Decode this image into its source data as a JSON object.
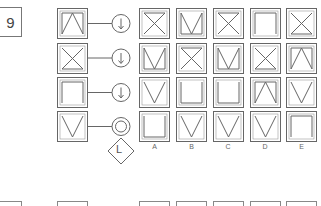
{
  "question": {
    "number": "9"
  },
  "colors": {
    "stroke": "#666666",
    "outer_border": "#777777",
    "background": "#ffffff"
  },
  "sequence_rows": [
    {
      "shape": "lambda-top-bar",
      "operator": "arrow-down"
    },
    {
      "shape": "x-bottom-bar",
      "operator": "arrow-down"
    },
    {
      "shape": "inverted-u",
      "operator": "arrow-down"
    },
    {
      "shape": "v",
      "operator": "double-circle"
    }
  ],
  "final_operator": {
    "shape": "diamond",
    "label": "L"
  },
  "options": {
    "labels": [
      "A",
      "B",
      "C",
      "D",
      "E"
    ],
    "grid": [
      [
        "x-top-bar",
        "m-bottom",
        "x-top-bar",
        "inverted-u",
        "x-bottom-bar"
      ],
      [
        "m-bottom",
        "x-top-bar",
        "m-bottom",
        "x-bottom-bar",
        "lambda-top-bar"
      ],
      [
        "v",
        "u",
        "u",
        "lambda-top-bar",
        "v"
      ],
      [
        "u",
        "v",
        "v",
        "v",
        "inverted-u"
      ]
    ]
  },
  "next_question_preview": {
    "visible": true
  }
}
